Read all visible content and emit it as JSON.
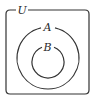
{
  "diagram": {
    "type": "venn",
    "universe": {
      "label": "U"
    },
    "sets": [
      {
        "label": "A",
        "contains": [
          "B"
        ]
      },
      {
        "label": "B",
        "contained_in": "A"
      }
    ],
    "relationship": "B ⊂ A ⊂ U",
    "stroke_color": "#333333",
    "background": "#ffffff"
  }
}
